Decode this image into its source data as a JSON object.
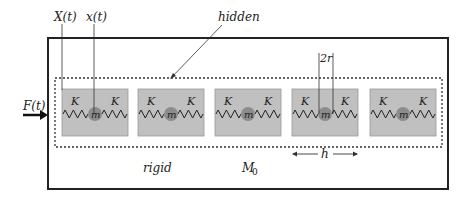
{
  "labels": {
    "X": "X(t)",
    "x": "x(t)",
    "hidden": "hidden",
    "force": "F(t)",
    "two_r": "2r",
    "h": "h",
    "rigid": "rigid",
    "M0_main": "M",
    "M0_sub": "0"
  },
  "cell": {
    "spring_label": "K",
    "mass_label": "m"
  },
  "cells_x": [
    62,
    138,
    215,
    292,
    370
  ],
  "colors": {
    "box_fill": "#c0c0c0",
    "ball_fill": "#8c8c8c",
    "line": "#222222"
  }
}
